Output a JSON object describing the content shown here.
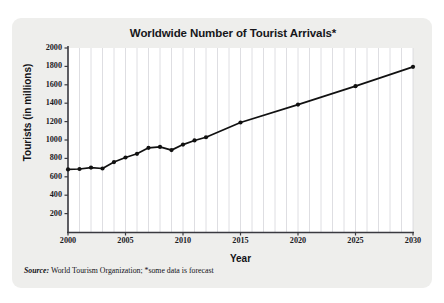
{
  "card": {
    "background": "#eeeeec",
    "plot_background": "#ffffff"
  },
  "chart_data": {
    "type": "line",
    "title": "Worldwide Number of Tourist Arrivals*",
    "xlabel": "Year",
    "ylabel": "Tourists (in millions)",
    "xlim": [
      2000,
      2030
    ],
    "ylim": [
      0,
      2000
    ],
    "ytick_labels": [
      "2000",
      "1800",
      "1600",
      "1400",
      "1200",
      "1000",
      "800",
      "600",
      "400",
      "200"
    ],
    "ytick_values": [
      2000,
      1800,
      1600,
      1400,
      1200,
      1000,
      800,
      600,
      400,
      200
    ],
    "xtick_labels": [
      "2000",
      "2005",
      "2010",
      "2015",
      "2020",
      "2025",
      "2030"
    ],
    "xtick_values": [
      2000,
      2005,
      2010,
      2015,
      2020,
      2025,
      2030
    ],
    "grid": "vertical-only",
    "gridline_years": [
      2000,
      2001,
      2002,
      2003,
      2004,
      2005,
      2006,
      2007,
      2008,
      2009,
      2010,
      2011,
      2012,
      2013,
      2014,
      2015,
      2016,
      2017,
      2018,
      2019,
      2020,
      2021,
      2022,
      2023,
      2024,
      2025,
      2026,
      2027,
      2028,
      2029,
      2030
    ],
    "legend": "none",
    "line_color": "#111111",
    "marker_color": "#111111",
    "series": [
      {
        "name": "Tourist arrivals",
        "x": [
          2000,
          2001,
          2002,
          2003,
          2004,
          2005,
          2006,
          2007,
          2008,
          2009,
          2010,
          2011,
          2012,
          2015,
          2020,
          2025,
          2030
        ],
        "values": [
          680,
          685,
          700,
          690,
          760,
          810,
          850,
          915,
          925,
          890,
          950,
          995,
          1030,
          1190,
          1385,
          1585,
          1795
        ]
      }
    ],
    "annotations": [
      "*some data is forecast"
    ]
  },
  "source_note": {
    "label": "Source:",
    "text": "World Tourism Organization; *some data is forecast"
  }
}
